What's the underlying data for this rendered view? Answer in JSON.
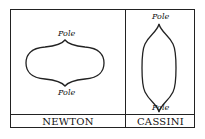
{
  "panels": [
    {
      "name": "NEWTON",
      "shape": "oblate",
      "top_label": "Pole",
      "bottom_label": "Pole"
    },
    {
      "name": "CASSINI",
      "shape": "prolate",
      "top_label": "Pole",
      "bottom_label": "Pole"
    }
  ],
  "colors": {
    "ink": "#222222",
    "background": "#ffffff"
  }
}
